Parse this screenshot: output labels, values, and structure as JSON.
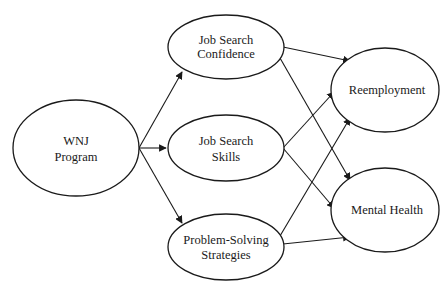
{
  "diagram": {
    "type": "path-model",
    "nodes": {
      "wnj": {
        "line1": "WNJ",
        "line2": "Program"
      },
      "confidence": {
        "line1": "Job Search",
        "line2": "Confidence"
      },
      "skills": {
        "line1": "Job Search",
        "line2": "Skills"
      },
      "problem": {
        "line1": "Problem-Solving",
        "line2": "Strategies"
      },
      "reemployment": {
        "label": "Reemployment"
      },
      "mental": {
        "label": "Mental Health"
      }
    },
    "edges": [
      {
        "from": "WNJ Program",
        "to": "Job Search Confidence"
      },
      {
        "from": "WNJ Program",
        "to": "Job Search Skills"
      },
      {
        "from": "WNJ Program",
        "to": "Problem-Solving Strategies"
      },
      {
        "from": "Job Search Confidence",
        "to": "Reemployment"
      },
      {
        "from": "Job Search Confidence",
        "to": "Mental Health"
      },
      {
        "from": "Job Search Skills",
        "to": "Reemployment"
      },
      {
        "from": "Job Search Skills",
        "to": "Mental Health"
      },
      {
        "from": "Problem-Solving Strategies",
        "to": "Reemployment"
      },
      {
        "from": "Problem-Solving Strategies",
        "to": "Mental Health"
      }
    ]
  }
}
